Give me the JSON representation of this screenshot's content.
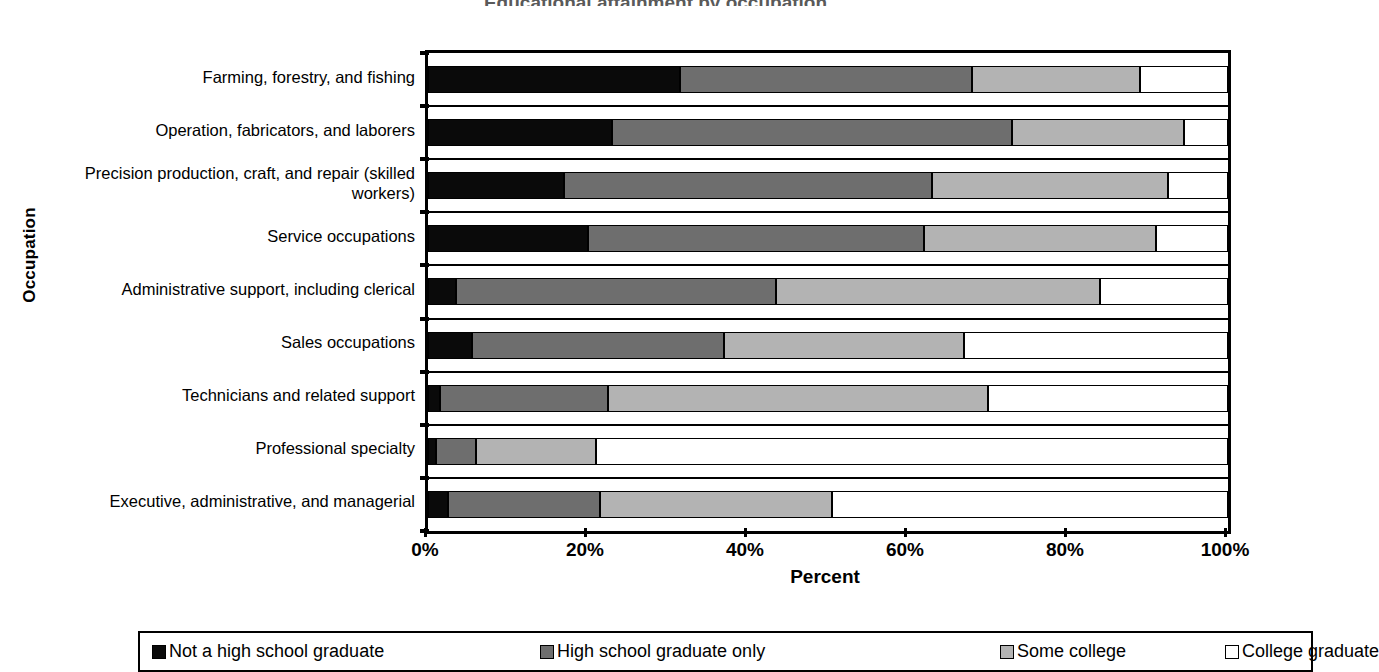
{
  "chart_data": {
    "type": "bar",
    "orientation": "horizontal",
    "stacked": true,
    "title": "Educational attainment by occupation",
    "xlabel": "Percent",
    "ylabel": "Occupation",
    "xlim": [
      0,
      100
    ],
    "xticks": [
      "0%",
      "20%",
      "40%",
      "60%",
      "80%",
      "100%"
    ],
    "xtick_values": [
      0,
      20,
      40,
      60,
      80,
      100
    ],
    "grid": false,
    "legend_position": "bottom",
    "categories": [
      "Farming, forestry, and fishing",
      "Operation, fabricators, and laborers",
      "Precision production, craft, and repair (skilled workers)",
      "Service occupations",
      "Administrative support, including clerical",
      "Sales occupations",
      "Technicians and related support",
      "Professional specialty",
      "Executive, administrative, and managerial"
    ],
    "series": [
      {
        "name": "Not a high school graduate",
        "color": "#0a0a0a",
        "values": [
          31.5,
          23.0,
          17.0,
          20.0,
          3.5,
          5.5,
          1.5,
          1.0,
          2.5
        ]
      },
      {
        "name": "High school graduate only",
        "color": "#6e6e6e",
        "values": [
          36.5,
          50.0,
          46.0,
          42.0,
          40.0,
          31.5,
          21.0,
          5.0,
          19.0
        ]
      },
      {
        "name": "Some college",
        "color": "#b3b3b3",
        "values": [
          21.0,
          21.5,
          29.5,
          29.0,
          40.5,
          30.0,
          47.5,
          15.0,
          29.0
        ]
      },
      {
        "name": "College graduate",
        "color": "#ffffff",
        "values": [
          11.0,
          5.5,
          7.5,
          9.0,
          16.0,
          33.0,
          30.0,
          79.0,
          49.5
        ]
      }
    ]
  },
  "legend": {
    "items": [
      {
        "label": "Not a high school graduate",
        "swatch": "sw0"
      },
      {
        "label": "High school graduate only",
        "swatch": "sw1"
      },
      {
        "label": "Some college",
        "swatch": "sw2"
      },
      {
        "label": "College graduate",
        "swatch": "sw3"
      }
    ]
  }
}
